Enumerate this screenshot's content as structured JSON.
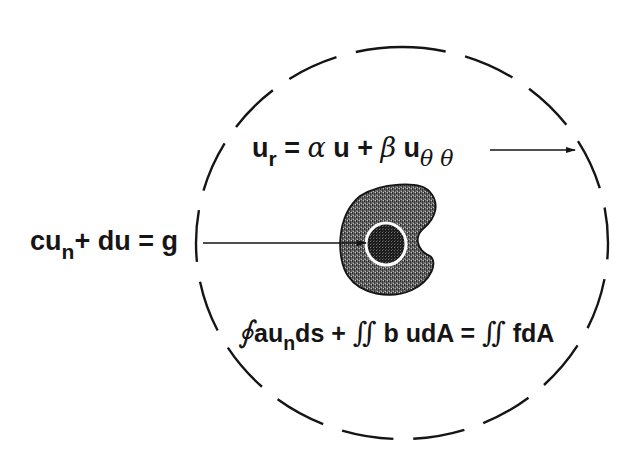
{
  "diagram": {
    "type": "boundary-value-problem-schematic",
    "colors": {
      "ink": "#151515",
      "background": "#ffffff",
      "shading": "#555555"
    },
    "outer_boundary": {
      "style": "dashed-circle",
      "center": [
        402,
        243
      ],
      "rx": 196,
      "ry": 206
    },
    "obstacle": {
      "shape": "kidney-shaped shaded region with dark circular inclusion"
    },
    "labels": {
      "top_condition": {
        "lhs_base": "u",
        "lhs_sub": "r",
        "eq": " = ",
        "alpha": "α",
        "term1": " u + ",
        "beta": "β",
        "term2": " u",
        "sub2": "θ θ"
      },
      "left_condition": {
        "base1": "cu",
        "sub1": "n",
        "rest": "+ du = g"
      },
      "bottom_condition": {
        "oint": "∮",
        "part1": "au",
        "sub1": "n",
        "part2": "ds + ",
        "iint1": "∬",
        "part3": " b udA = ",
        "iint2": "∬",
        "part4": " fdA"
      }
    },
    "arrows": [
      {
        "name": "top-arrow",
        "from": [
          490,
          150
        ],
        "to": [
          575,
          150
        ]
      },
      {
        "name": "left-arrow",
        "from": [
          203,
          243
        ],
        "to": [
          365,
          243
        ]
      }
    ]
  }
}
